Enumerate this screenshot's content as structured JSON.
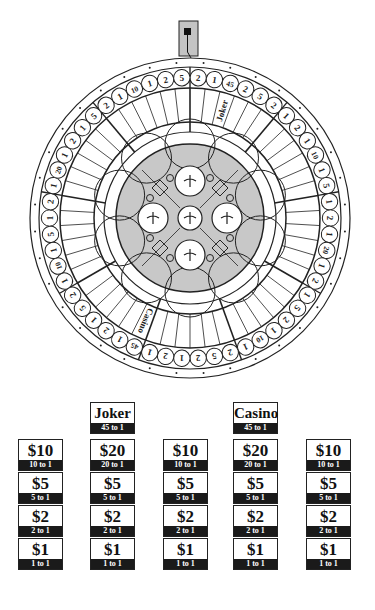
{
  "wheel": {
    "pointer": "wheel-pointer",
    "segment_labels": [
      "2",
      "1",
      "45",
      "2",
      "5",
      "2",
      "1",
      "2",
      "1",
      "10",
      "1",
      "5",
      "1",
      "2",
      "1",
      "20",
      "1",
      "2",
      "1",
      "5",
      "2",
      "1",
      "10",
      "1",
      "2",
      "5",
      "2",
      "1",
      "2",
      "1",
      "45",
      "1",
      "2",
      "1",
      "5",
      "2",
      "1",
      "10",
      "1",
      "5",
      "1",
      "2",
      "1",
      "20",
      "1",
      "2",
      "1",
      "5",
      "2",
      "1",
      "10",
      "1",
      "2",
      "5"
    ],
    "special_labels": {
      "2": "Joker",
      "30": "Casino"
    }
  },
  "bets": {
    "specials": [
      {
        "amount": "Joker",
        "odds": "45 to 1"
      },
      {
        "amount": "Casino",
        "odds": "45 to 1"
      }
    ],
    "columns": [
      [
        {
          "amount": "$10",
          "odds": "10 to 1"
        },
        {
          "amount": "$5",
          "odds": "5 to 1"
        },
        {
          "amount": "$2",
          "odds": "2 to 1"
        },
        {
          "amount": "$1",
          "odds": "1 to 1"
        }
      ],
      [
        {
          "amount": "$20",
          "odds": "20 to 1"
        },
        {
          "amount": "$5",
          "odds": "5 to 1"
        },
        {
          "amount": "$2",
          "odds": "2 to 1"
        },
        {
          "amount": "$1",
          "odds": "1 to 1"
        }
      ],
      [
        {
          "amount": "$10",
          "odds": "10 to 1"
        },
        {
          "amount": "$5",
          "odds": "5 to 1"
        },
        {
          "amount": "$2",
          "odds": "2 to 1"
        },
        {
          "amount": "$1",
          "odds": "1 to 1"
        }
      ],
      [
        {
          "amount": "$20",
          "odds": "20 to 1"
        },
        {
          "amount": "$5",
          "odds": "5 to 1"
        },
        {
          "amount": "$2",
          "odds": "2 to 1"
        },
        {
          "amount": "$1",
          "odds": "1 to 1"
        }
      ],
      [
        {
          "amount": "$10",
          "odds": "10 to 1"
        },
        {
          "amount": "$5",
          "odds": "5 to 1"
        },
        {
          "amount": "$2",
          "odds": "2 to 1"
        },
        {
          "amount": "$1",
          "odds": "1 to 1"
        }
      ]
    ]
  },
  "colors": {
    "hub_gray": "#c8c8c8",
    "pointer_gray": "#c4c4c4",
    "ink": "#1a1a1a"
  }
}
